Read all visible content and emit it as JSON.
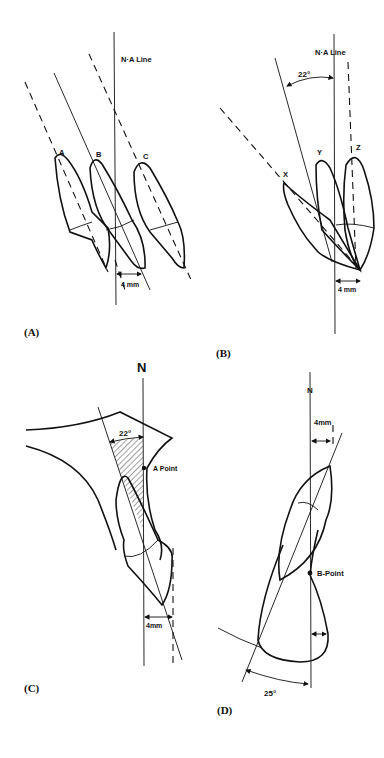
{
  "figure": {
    "panels": [
      {
        "id": "A",
        "label": "(A)",
        "line_label": "N·A Line",
        "teeth": [
          "A",
          "B",
          "C"
        ],
        "measurement": "4 mm"
      },
      {
        "id": "B",
        "label": "(B)",
        "line_label": "N·A Line",
        "angle": "22°",
        "teeth": [
          "X",
          "Y",
          "Z"
        ],
        "measurement": "4 mm"
      },
      {
        "id": "C",
        "label": "(C)",
        "line_label": "N",
        "angle": "22°",
        "point_label": "A Point",
        "measurement": "4mm"
      },
      {
        "id": "D",
        "label": "(D)",
        "line_label": "N",
        "angle": "25°",
        "point_label": "B-Point",
        "measurement": "4mm"
      }
    ]
  }
}
